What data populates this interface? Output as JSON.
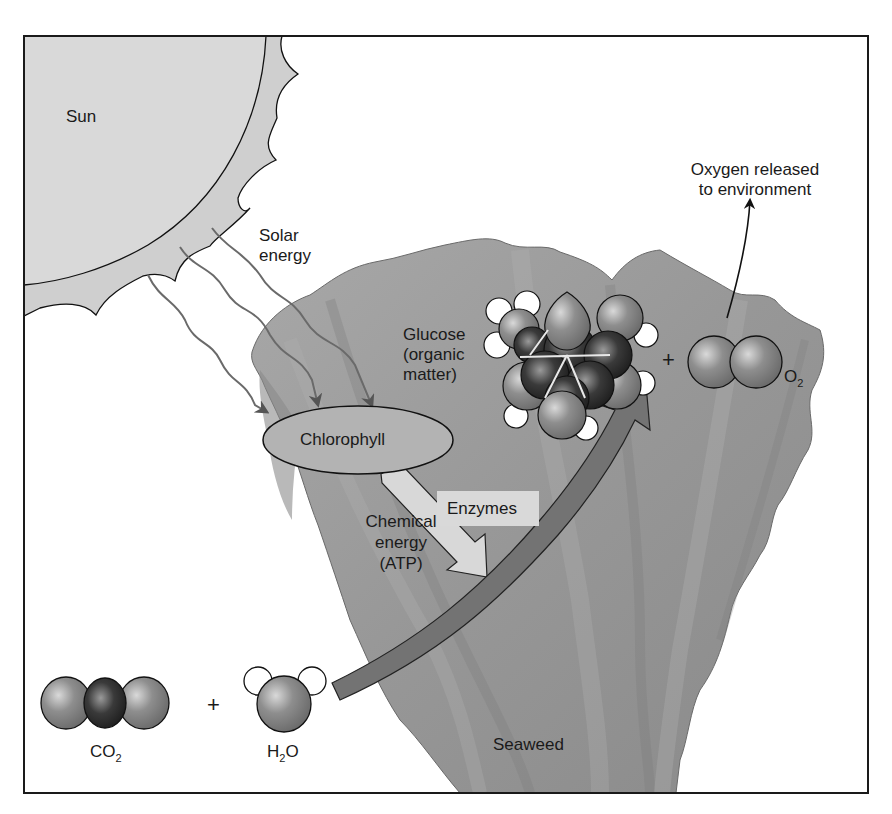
{
  "figure": {
    "colors": {
      "frame": "#1a1a1a",
      "sun_core": "#d8d8d8",
      "sun_corona": "#cfcfcf",
      "seaweed": "#9a9a9a",
      "seaweed_shadow": "#858585",
      "chlorophyll_fill": "#b3b3b3",
      "enzyme_arrow": "#d5d5d5",
      "energy_arrow": "#6f6f6f",
      "ray": "#6a6a6a",
      "oxygen_atom": "#8c8c8c",
      "carbon_atom": "#2e2e2e",
      "hydrogen_atom": "#ffffff"
    }
  },
  "labels": {
    "sun": "Sun",
    "solar_energy": [
      "Solar",
      "energy"
    ],
    "chlorophyll": "Chlorophyll",
    "enzymes": "Enzymes",
    "chemical_energy": [
      "Chemical",
      "energy",
      "(ATP)"
    ],
    "glucose": [
      "Glucose",
      "(organic",
      "matter)"
    ],
    "oxygen_released": [
      "Oxygen released",
      "to environment"
    ],
    "seaweed": "Seaweed",
    "plus_reactants": "+",
    "plus_products": "+"
  },
  "molecules": {
    "co2": {
      "base": "CO",
      "subscript": "2"
    },
    "h2o": {
      "prefix": "H",
      "subscript": "2",
      "suffix": "O"
    },
    "o2": {
      "base": "O",
      "subscript": "2"
    }
  }
}
